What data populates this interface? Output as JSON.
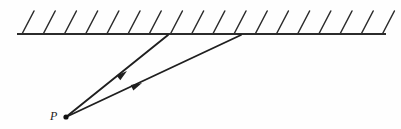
{
  "figure": {
    "type": "ray-diagram",
    "background_color": "#fefefe",
    "stroke_color": "#1f1f1f",
    "canvas": {
      "width": 401,
      "height": 129
    },
    "labels": [
      {
        "id": "P",
        "text": "P",
        "x": 50,
        "y": 120,
        "style": "italic-serif"
      }
    ],
    "point_source": {
      "name": "P",
      "x": 66,
      "y": 117,
      "radius": 2.6,
      "color": "#111111"
    },
    "surface": {
      "name": "hatched-boundary-line",
      "x1": 17,
      "y1": 34,
      "x2": 386,
      "y2": 34,
      "thickness": 2.2,
      "color": "#2b2b2b"
    },
    "hatching": {
      "name": "surface-hatching",
      "count": 18,
      "start_x": 22,
      "spacing": 21.2,
      "dx": 12,
      "dy": -23,
      "thickness": 1.5,
      "color": "#2b2b2b"
    },
    "rays": [
      {
        "name": "ray-1",
        "from_x": 66,
        "from_y": 117,
        "to_x": 168,
        "to_y": 35,
        "arrow_at": 0.55,
        "thickness": 1.9
      },
      {
        "name": "ray-2",
        "from_x": 66,
        "from_y": 117,
        "to_x": 241,
        "to_y": 35,
        "arrow_at": 0.42,
        "thickness": 1.9
      }
    ],
    "arrowheads": [
      {
        "name": "arrowhead-ray-1",
        "x": 127,
        "y": 71,
        "angle_deg": -38.8,
        "length": 11,
        "width": 6
      },
      {
        "name": "arrowhead-ray-2",
        "x": 142,
        "y": 83,
        "angle_deg": -25.1,
        "length": 11,
        "width": 6
      }
    ]
  }
}
